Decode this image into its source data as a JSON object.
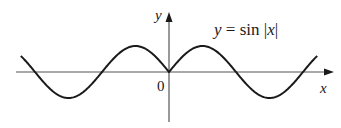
{
  "chart_data": {
    "type": "line",
    "title": "",
    "xlabel": "x",
    "ylabel": "y",
    "origin_label": "0",
    "annotations": [
      {
        "text": "y = sin |x|",
        "position": "upper-right"
      }
    ],
    "series": [
      {
        "name": "y = sin |x|",
        "function": "sin(abs(x))",
        "x_range": [
          -6.95,
          6.95
        ],
        "points": [
          [
            -6.95,
            0.62
          ],
          [
            -6.28,
            0
          ],
          [
            -4.71,
            -1
          ],
          [
            -3.14,
            0
          ],
          [
            -1.57,
            1
          ],
          [
            0,
            0
          ],
          [
            1.57,
            1
          ],
          [
            3.14,
            0
          ],
          [
            4.71,
            -1
          ],
          [
            6.28,
            0
          ],
          [
            6.95,
            0.62
          ]
        ]
      }
    ],
    "xlim": [
      -7.4,
      7.4
    ],
    "ylim": [
      -1.9,
      2.3
    ],
    "grid": false,
    "legend": false,
    "tick_labels": false
  },
  "labels": {
    "x_axis": "x",
    "y_axis": "y",
    "origin": "0",
    "equation_y": "y",
    "equation_eq": " = sin |",
    "equation_x": "x",
    "equation_bar": "|"
  }
}
